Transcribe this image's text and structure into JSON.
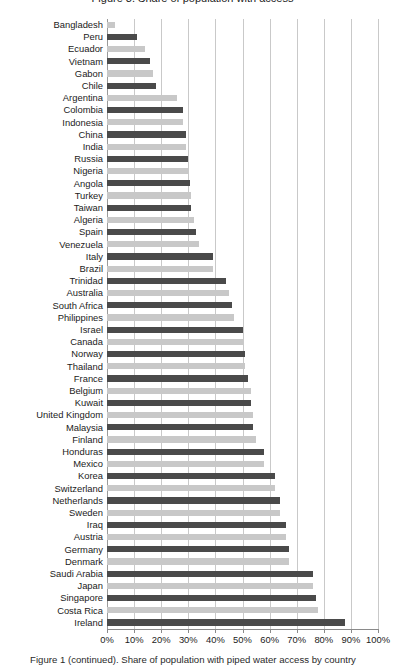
{
  "figure": {
    "title_clipped": "Figure 3. Share of population with access",
    "caption_clipped": "Figure 1 (continued). Share of population with piped water access by country",
    "colors": {
      "bar_dark": "#4a4a4a",
      "bar_light": "#c8c8c8",
      "gridline": "#c9c9c9",
      "axis": "#8a8a8a",
      "text": "#1b1b1b",
      "background": "#ffffff"
    }
  },
  "chart_data": {
    "type": "bar",
    "orientation": "horizontal",
    "title": "",
    "xlabel": "",
    "ylabel": "",
    "xlim": [
      0,
      100
    ],
    "xunit": "%",
    "grid": true,
    "gridlines_x": [
      0,
      10,
      20,
      30,
      40,
      50,
      60,
      70,
      80,
      90,
      100
    ],
    "legend": null,
    "xticklabels": [
      "0%",
      "10%",
      "20%",
      "30%",
      "40%",
      "50%",
      "60%",
      "70%",
      "80%",
      "90%",
      "100%"
    ],
    "xtickvalues": [
      0,
      10,
      20,
      30,
      40,
      50,
      60,
      70,
      80,
      90,
      100
    ],
    "categories": [
      "Bangladesh",
      "Peru",
      "Ecuador",
      "Vietnam",
      "Gabon",
      "Chile",
      "Argentina",
      "Colombia",
      "Indonesia",
      "China",
      "India",
      "Russia",
      "Nigeria",
      "Angola",
      "Turkey",
      "Taiwan",
      "Algeria",
      "Spain",
      "Venezuela",
      "Italy",
      "Brazil",
      "Trinidad",
      "Australia",
      "South Africa",
      "Philippines",
      "Israel",
      "Canada",
      "Norway",
      "Thailand",
      "France",
      "Belgium",
      "Kuwait",
      "United Kingdom",
      "Malaysia",
      "Finland",
      "Honduras",
      "Mexico",
      "Korea",
      "Switzerland",
      "Netherlands",
      "Sweden",
      "Iraq",
      "Austria",
      "Germany",
      "Denmark",
      "Saudi Arabia",
      "Japan",
      "Singapore",
      "Costa Rica",
      "Ireland"
    ],
    "values": [
      3,
      11,
      14,
      16,
      17,
      18,
      26,
      28,
      28,
      29,
      29,
      30,
      30,
      30.5,
      31,
      31,
      32,
      33,
      34,
      39,
      39,
      44,
      45,
      46,
      47,
      50,
      50,
      51,
      51,
      52,
      53,
      53,
      54,
      54,
      55,
      58,
      58,
      62,
      62,
      64,
      64,
      66,
      66,
      67,
      67,
      76,
      76,
      77,
      78,
      88
    ]
  }
}
